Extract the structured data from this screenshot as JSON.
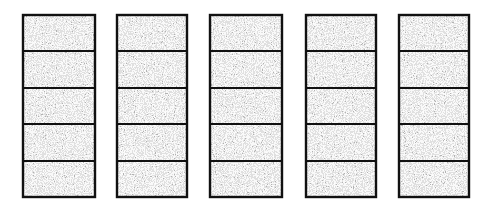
{
  "diagram": {
    "background": "#ffffff",
    "stroke_color": "#111111",
    "fill_base": "#b4b4b4",
    "top": 15,
    "bottom": 197,
    "dividers_y": [
      51,
      88,
      124,
      161
    ],
    "columns": [
      {
        "id": 1,
        "x": 23,
        "width": 72,
        "cells": 5
      },
      {
        "id": 2,
        "x": 117,
        "width": 70,
        "cells": 5
      },
      {
        "id": 3,
        "x": 210,
        "width": 72,
        "cells": 5
      },
      {
        "id": 4,
        "x": 306,
        "width": 70,
        "cells": 5
      },
      {
        "id": 5,
        "x": 399,
        "width": 70,
        "cells": 5
      }
    ]
  }
}
